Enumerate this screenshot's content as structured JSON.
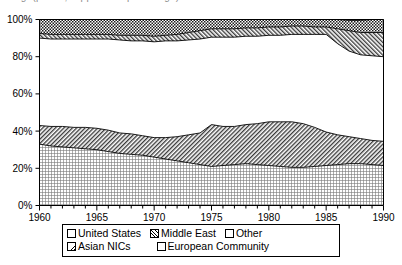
{
  "title": {
    "text": "Fig. (partial, clipped at top of image)",
    "clipped": true
  },
  "legend": {
    "position": "below-plot",
    "rows": [
      [
        {
          "label": "United States",
          "pattern": "dot-grid",
          "name": "legend-united-states"
        },
        {
          "label": "Middle East",
          "pattern": "diagonal-hatch-right",
          "name": "legend-middle-east"
        },
        {
          "label": "Other",
          "pattern": "solid-white",
          "name": "legend-other"
        }
      ],
      [
        {
          "label": "Asian NICs",
          "pattern": "diagonal-hatch-left",
          "name": "legend-asian-nics"
        },
        {
          "label": "European Community",
          "pattern": "checkerboard",
          "name": "legend-european-community"
        }
      ]
    ]
  },
  "chart_data": {
    "type": "area",
    "stacked": true,
    "normalized": true,
    "title": "",
    "subtitle": "",
    "xlabel": "",
    "ylabel": "",
    "xlim": [
      1960,
      1990
    ],
    "ylim": [
      0,
      100
    ],
    "grid": false,
    "legend_position": "bottom",
    "x_major_ticks": [
      1960,
      1965,
      1970,
      1975,
      1980,
      1985,
      1990
    ],
    "x_minor_tick_step": 1,
    "x_tick_labels": [
      "1960",
      "1965",
      "1970",
      "1975",
      "1980",
      "1985",
      "1990"
    ],
    "y_ticks": [
      0,
      20,
      40,
      60,
      80,
      100
    ],
    "y_tick_labels": [
      "0%",
      "20%",
      "40%",
      "60%",
      "80%",
      "100%"
    ],
    "x": [
      1960,
      1961,
      1962,
      1963,
      1964,
      1965,
      1966,
      1967,
      1968,
      1969,
      1970,
      1971,
      1972,
      1973,
      1974,
      1975,
      1976,
      1977,
      1978,
      1979,
      1980,
      1981,
      1982,
      1983,
      1984,
      1985,
      1986,
      1987,
      1988,
      1989,
      1990
    ],
    "series": [
      {
        "name": "United States",
        "pattern": "dot-grid",
        "values": [
          33,
          32,
          31.5,
          31,
          30.5,
          30,
          29,
          28,
          27.5,
          27,
          26,
          25,
          24,
          23,
          22,
          21,
          21.5,
          22,
          22.5,
          22,
          21.5,
          21,
          20.5,
          20.5,
          21,
          21.5,
          22,
          22.5,
          22.5,
          22,
          21.5
        ]
      },
      {
        "name": "Asian NICs",
        "pattern": "diagonal-hatch-left",
        "values": [
          10,
          10.5,
          11,
          11,
          11.5,
          11.5,
          11.5,
          11,
          11,
          10.5,
          10.5,
          11.5,
          13,
          15,
          17,
          22.5,
          21,
          20.5,
          21,
          22,
          23.5,
          24,
          24.5,
          23.5,
          21,
          18,
          16,
          14.5,
          13.5,
          13,
          13
        ]
      },
      {
        "name": "Other",
        "pattern": "solid-white",
        "values": [
          47,
          47,
          47,
          47.5,
          47.5,
          48,
          49,
          50,
          50,
          51,
          51.5,
          52,
          51.5,
          51,
          50.5,
          47,
          48,
          48,
          47.5,
          47,
          46.5,
          46.5,
          47,
          48,
          50,
          52.5,
          49,
          46,
          45,
          45.5,
          45.5
        ]
      },
      {
        "name": "Middle East",
        "pattern": "diagonal-hatch-right",
        "values": [
          2.5,
          2.5,
          2.5,
          2.5,
          2.5,
          2.5,
          2.5,
          2.5,
          3,
          3,
          3,
          3,
          3.5,
          4,
          4.5,
          4.5,
          4.5,
          4.5,
          4.5,
          4.5,
          4.5,
          4.5,
          4.5,
          4.5,
          4,
          4,
          8,
          11,
          12,
          12.5,
          13
        ]
      },
      {
        "name": "European Community",
        "pattern": "checkerboard",
        "values": [
          7.5,
          8,
          8,
          8,
          8,
          8,
          8,
          8.5,
          8.5,
          8.5,
          9,
          8.5,
          8,
          7,
          6,
          5,
          5,
          5,
          4.5,
          4.5,
          4,
          4,
          3.5,
          3.5,
          4,
          4,
          5,
          5.5,
          6.5,
          7,
          7
        ]
      }
    ]
  }
}
